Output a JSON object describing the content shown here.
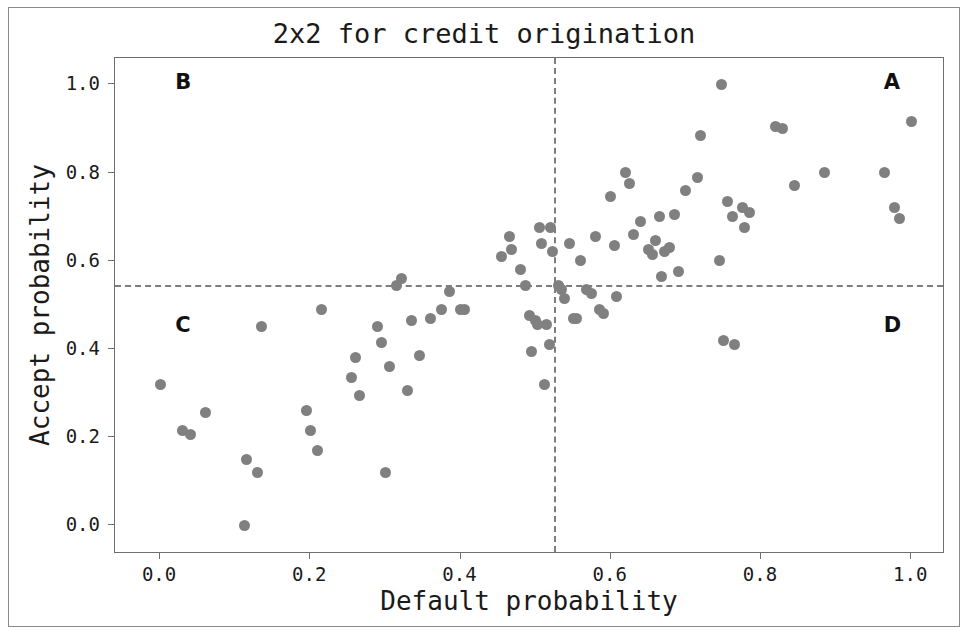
{
  "chart_data": {
    "type": "scatter",
    "title": "2x2 for credit origination",
    "xlabel": "Default probability",
    "ylabel": "Accept probability",
    "xlim": [
      -0.06,
      1.045
    ],
    "ylim": [
      -0.065,
      1.06
    ],
    "xticks": [
      "0.0",
      "0.2",
      "0.4",
      "0.6",
      "0.8",
      "1.0"
    ],
    "xtick_values": [
      0.0,
      0.2,
      0.4,
      0.6,
      0.8,
      1.0
    ],
    "yticks": [
      "0.0",
      "0.2",
      "0.4",
      "0.6",
      "0.8",
      "1.0"
    ],
    "ytick_values": [
      0.0,
      0.2,
      0.4,
      0.6,
      0.8,
      1.0
    ],
    "grid": false,
    "legend": "none",
    "marker_color": "#808080",
    "reference_lines": {
      "vertical_x": 0.525,
      "horizontal_y": 0.545,
      "style": "dashed",
      "color": "#7d7d7d"
    },
    "quadrant_labels": [
      {
        "label": "B",
        "x": 0.015,
        "y": 1.0
      },
      {
        "label": "A",
        "x": 0.99,
        "y": 1.0
      },
      {
        "label": "C",
        "x": 0.015,
        "y": 0.45
      },
      {
        "label": "D",
        "x": 0.99,
        "y": 0.45
      }
    ],
    "points": [
      [
        0.0,
        0.32
      ],
      [
        0.03,
        0.215
      ],
      [
        0.04,
        0.205
      ],
      [
        0.06,
        0.255
      ],
      [
        0.115,
        0.15
      ],
      [
        0.112,
        0.0
      ],
      [
        0.13,
        0.12
      ],
      [
        0.135,
        0.45
      ],
      [
        0.195,
        0.26
      ],
      [
        0.2,
        0.215
      ],
      [
        0.21,
        0.17
      ],
      [
        0.215,
        0.49
      ],
      [
        0.255,
        0.335
      ],
      [
        0.26,
        0.38
      ],
      [
        0.265,
        0.295
      ],
      [
        0.29,
        0.45
      ],
      [
        0.295,
        0.415
      ],
      [
        0.3,
        0.12
      ],
      [
        0.305,
        0.36
      ],
      [
        0.315,
        0.545
      ],
      [
        0.322,
        0.56
      ],
      [
        0.33,
        0.305
      ],
      [
        0.335,
        0.465
      ],
      [
        0.345,
        0.385
      ],
      [
        0.36,
        0.47
      ],
      [
        0.375,
        0.49
      ],
      [
        0.385,
        0.53
      ],
      [
        0.4,
        0.49
      ],
      [
        0.405,
        0.49
      ],
      [
        0.455,
        0.61
      ],
      [
        0.465,
        0.655
      ],
      [
        0.468,
        0.625
      ],
      [
        0.48,
        0.58
      ],
      [
        0.487,
        0.545
      ],
      [
        0.492,
        0.475
      ],
      [
        0.495,
        0.395
      ],
      [
        0.5,
        0.465
      ],
      [
        0.503,
        0.455
      ],
      [
        0.505,
        0.675
      ],
      [
        0.508,
        0.64
      ],
      [
        0.512,
        0.32
      ],
      [
        0.515,
        0.455
      ],
      [
        0.518,
        0.41
      ],
      [
        0.52,
        0.675
      ],
      [
        0.523,
        0.62
      ],
      [
        0.53,
        0.545
      ],
      [
        0.535,
        0.535
      ],
      [
        0.538,
        0.515
      ],
      [
        0.545,
        0.64
      ],
      [
        0.55,
        0.47
      ],
      [
        0.555,
        0.47
      ],
      [
        0.56,
        0.6
      ],
      [
        0.568,
        0.535
      ],
      [
        0.575,
        0.525
      ],
      [
        0.58,
        0.655
      ],
      [
        0.585,
        0.49
      ],
      [
        0.59,
        0.48
      ],
      [
        0.6,
        0.745
      ],
      [
        0.605,
        0.635
      ],
      [
        0.608,
        0.52
      ],
      [
        0.62,
        0.8
      ],
      [
        0.625,
        0.775
      ],
      [
        0.63,
        0.66
      ],
      [
        0.64,
        0.69
      ],
      [
        0.65,
        0.625
      ],
      [
        0.655,
        0.615
      ],
      [
        0.66,
        0.645
      ],
      [
        0.665,
        0.7
      ],
      [
        0.668,
        0.565
      ],
      [
        0.672,
        0.62
      ],
      [
        0.678,
        0.63
      ],
      [
        0.685,
        0.705
      ],
      [
        0.69,
        0.575
      ],
      [
        0.7,
        0.76
      ],
      [
        0.715,
        0.79
      ],
      [
        0.72,
        0.885
      ],
      [
        0.745,
        0.6
      ],
      [
        0.748,
        1.0
      ],
      [
        0.75,
        0.42
      ],
      [
        0.765,
        0.41
      ],
      [
        0.755,
        0.735
      ],
      [
        0.762,
        0.7
      ],
      [
        0.775,
        0.72
      ],
      [
        0.778,
        0.675
      ],
      [
        0.785,
        0.71
      ],
      [
        0.82,
        0.905
      ],
      [
        0.828,
        0.9
      ],
      [
        0.845,
        0.77
      ],
      [
        0.885,
        0.8
      ],
      [
        0.965,
        0.8
      ],
      [
        0.978,
        0.72
      ],
      [
        0.985,
        0.695
      ],
      [
        1.0,
        0.915
      ]
    ]
  }
}
